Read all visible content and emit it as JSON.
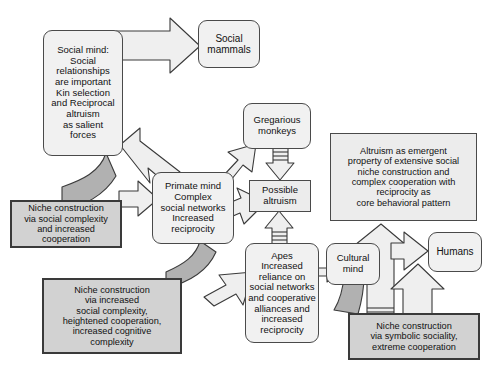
{
  "diagram": {
    "background_color": "#ffffff",
    "palette": {
      "rounded_node_fill": "#f1f1f1",
      "gray_node_fill": "#d2d2d2",
      "light_node_fill": "#ececec",
      "arrow_fill": "#efefef",
      "feedback_arrow_fill": "#b9b9b9",
      "stroke": "#3a3a3a",
      "text": "#111111"
    },
    "nodes": [
      {
        "id": "social-mind",
        "label": "Social mind:\nSocial\nrelationships\nare important\nKin selection\nand Reciprocal\naltruism\nas salient\nforces",
        "shape": "rounded"
      },
      {
        "id": "social-mammals",
        "label": "Social\nmammals",
        "shape": "rounded"
      },
      {
        "id": "gregarious-monkeys",
        "label": "Gregarious\nmonkeys",
        "shape": "rounded"
      },
      {
        "id": "possible-altruism",
        "label": "Possible\naltruism",
        "shape": "boxed-lite"
      },
      {
        "id": "primate-mind",
        "label": "Primate mind\nComplex\nsocial networks\nIncreased\nreciprocity",
        "shape": "rounded"
      },
      {
        "id": "apes",
        "label": "Apes\nIncreased\nreliance on\nsocial networks\nand cooperative\nalliances and\nincreased\nreciprocity",
        "shape": "rounded"
      },
      {
        "id": "cultural-mind",
        "label": "Cultural\nmind",
        "shape": "rounded"
      },
      {
        "id": "humans",
        "label": "Humans",
        "shape": "rounded"
      },
      {
        "id": "altruism-emergent",
        "label": "Altruism as emergent\nproperty of extensive social\nniche construction and\ncomplex cooperation with\nreciprocity as\ncore behavioral pattern",
        "shape": "boxed-lite"
      },
      {
        "id": "niche-social-complexity",
        "label": "Niche construction\nvia social complexity\nand increased\ncooperation",
        "shape": "boxed"
      },
      {
        "id": "niche-increased-complexity",
        "label": "Niche construction\nvia increased\nsocial complexity,\nheightened cooperation,\nincreased cognitive\ncomplexity",
        "shape": "boxed"
      },
      {
        "id": "niche-symbolic",
        "label": "Niche construction\nvia symbolic sociality,\nextreme cooperation",
        "shape": "boxed"
      }
    ],
    "edges": [
      {
        "id": "social-mind-to-social-mammals",
        "from": "social-mind",
        "to": "social-mammals",
        "style": "block-arrow"
      },
      {
        "id": "social-mind-to-primate-mind",
        "from": "social-mind",
        "to": "primate-mind",
        "style": "block-arrow"
      },
      {
        "id": "social-mind-to-niche-social",
        "from": "social-mind",
        "to": "niche-social-complexity",
        "style": "feedback-curve"
      },
      {
        "id": "niche-social-to-primate-mind",
        "from": "niche-social-complexity",
        "to": "primate-mind",
        "style": "block-arrow"
      },
      {
        "id": "primate-mind-to-gregarious-monkeys",
        "from": "primate-mind",
        "to": "gregarious-monkeys",
        "style": "block-arrow"
      },
      {
        "id": "gregarious-monkeys-to-possible-altruism",
        "from": "gregarious-monkeys",
        "to": "possible-altruism",
        "style": "striped-arrow"
      },
      {
        "id": "primate-mind-to-apes",
        "from": "primate-mind",
        "to": "apes",
        "style": "block-arrow"
      },
      {
        "id": "apes-to-possible-altruism",
        "from": "apes",
        "to": "possible-altruism",
        "style": "striped-arrow"
      },
      {
        "id": "primate-mind-to-niche-increased",
        "from": "primate-mind",
        "to": "niche-increased-complexity",
        "style": "feedback-curve"
      },
      {
        "id": "niche-increased-to-apes",
        "from": "niche-increased-complexity",
        "to": "apes",
        "style": "block-arrow"
      },
      {
        "id": "apes-to-cultural-mind",
        "from": "apes",
        "to": "cultural-mind",
        "style": "block-arrow"
      },
      {
        "id": "cultural-mind-to-niche-symbolic",
        "from": "cultural-mind",
        "to": "niche-symbolic",
        "style": "feedback-curve"
      },
      {
        "id": "niche-symbolic-to-altruism-emergent",
        "from": "niche-symbolic",
        "to": "altruism-emergent",
        "style": "striped-arrow"
      },
      {
        "id": "cultural-mind-to-humans",
        "from": "cultural-mind",
        "to": "humans",
        "style": "block-arrow"
      },
      {
        "id": "niche-symbolic-to-humans",
        "from": "niche-symbolic",
        "to": "humans",
        "style": "block-arrow"
      }
    ]
  }
}
